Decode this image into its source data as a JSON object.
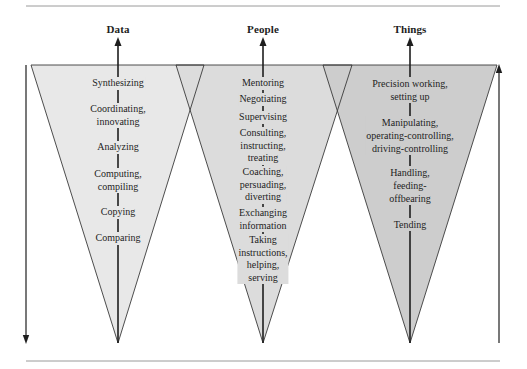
{
  "colors": {
    "data_fill": "#e8e8e8",
    "people_fill": "#dcdcdc",
    "things_fill": "#cdcdcd",
    "stroke": "#3a3a3a",
    "rule": "#9a9a9a"
  },
  "columns": [
    {
      "title": "Data",
      "arrow_icon": "arrow-up-icon",
      "items": [
        {
          "lines": [
            "Synthesizing"
          ]
        },
        {
          "lines": [
            "Coordinating,",
            "innovating"
          ]
        },
        {
          "lines": [
            "Analyzing"
          ]
        },
        {
          "lines": [
            "Computing,",
            "compiling"
          ]
        },
        {
          "lines": [
            "Copying"
          ]
        },
        {
          "lines": [
            "Comparing"
          ]
        }
      ]
    },
    {
      "title": "People",
      "arrow_icon": "arrow-up-icon",
      "items": [
        {
          "lines": [
            "Mentoring"
          ]
        },
        {
          "lines": [
            "Negotiating"
          ]
        },
        {
          "lines": [
            "Supervising"
          ]
        },
        {
          "lines": [
            "Consulting,",
            "instructing,",
            "treating"
          ]
        },
        {
          "lines": [
            "Coaching,",
            "persuading,",
            "diverting"
          ]
        },
        {
          "lines": [
            "Exchanging",
            "information"
          ]
        },
        {
          "lines": [
            "Taking",
            "instructions,",
            "helping,",
            "serving"
          ]
        }
      ]
    },
    {
      "title": "Things",
      "arrow_icon": "arrow-up-icon",
      "items": [
        {
          "lines": [
            "Precision working,",
            "setting up"
          ]
        },
        {
          "lines": [
            "Manipulating,",
            "operating-controlling,",
            "driving-controlling"
          ]
        },
        {
          "lines": [
            "Handling,",
            "feeding-",
            "offbearing"
          ]
        },
        {
          "lines": [
            "Tending"
          ]
        }
      ]
    }
  ],
  "side_arrows": {
    "left": {
      "icon": "arrow-down-icon",
      "direction": "down"
    },
    "right": {
      "icon": "arrow-up-icon",
      "direction": "up"
    }
  }
}
